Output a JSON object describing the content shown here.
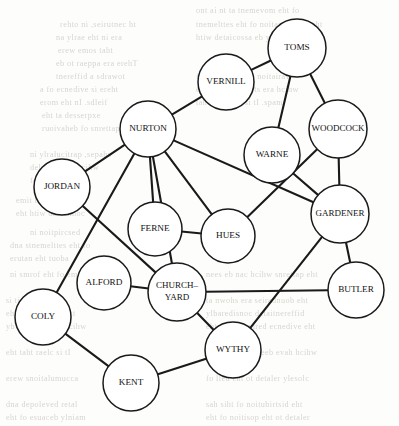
{
  "figure": {
    "kind": "node-link-network-diagram",
    "width": 399,
    "height": 426,
    "background_color": "#fdfdfb",
    "node_fill_color": "#ffffff",
    "node_stroke_color": "#1a1a1a",
    "edge_color": "#1a1a1a"
  },
  "nodes": [
    {
      "id": "toms",
      "label": "TOMS",
      "label_lines": [
        "TOMS"
      ],
      "x": 297,
      "y": 48,
      "r": 29,
      "font_size": 9.2
    },
    {
      "id": "vernill",
      "label": "VERNILL",
      "label_lines": [
        "VERNILL"
      ],
      "x": 226,
      "y": 82,
      "r": 28,
      "font_size": 9.2
    },
    {
      "id": "woodcock",
      "label": "WOODCOCK",
      "label_lines": [
        "WOODCOCK"
      ],
      "x": 338,
      "y": 129,
      "r": 29,
      "font_size": 9.0
    },
    {
      "id": "nurton",
      "label": "NURTON",
      "label_lines": [
        "NURTON"
      ],
      "x": 148,
      "y": 129,
      "r": 28,
      "font_size": 9.2
    },
    {
      "id": "warne",
      "label": "WARNE",
      "label_lines": [
        "WARNE"
      ],
      "x": 272,
      "y": 155,
      "r": 28,
      "font_size": 9.2
    },
    {
      "id": "jordan",
      "label": "JORDAN",
      "label_lines": [
        "JORDAN"
      ],
      "x": 62,
      "y": 187,
      "r": 28,
      "font_size": 9.2
    },
    {
      "id": "gardener",
      "label": "GARDENER",
      "label_lines": [
        "GARDENER"
      ],
      "x": 340,
      "y": 214,
      "r": 29,
      "font_size": 9.0
    },
    {
      "id": "ferne",
      "label": "FERNE",
      "label_lines": [
        "FERNE"
      ],
      "x": 155,
      "y": 229,
      "r": 27,
      "font_size": 9.2
    },
    {
      "id": "hues",
      "label": "HUES",
      "label_lines": [
        "HUES"
      ],
      "x": 228,
      "y": 236,
      "r": 27,
      "font_size": 9.2
    },
    {
      "id": "alford",
      "label": "ALFORD",
      "label_lines": [
        "ALFORD"
      ],
      "x": 104,
      "y": 283,
      "r": 27,
      "font_size": 9.2
    },
    {
      "id": "churchyard",
      "label": "CHURCH-YARD",
      "label_lines": [
        "CHURCH–",
        "YARD"
      ],
      "x": 177,
      "y": 292,
      "r": 29,
      "font_size": 9.0
    },
    {
      "id": "butler",
      "label": "BUTLER",
      "label_lines": [
        "BUTLER"
      ],
      "x": 356,
      "y": 290,
      "r": 28,
      "font_size": 9.2
    },
    {
      "id": "coly",
      "label": "COLY",
      "label_lines": [
        "COLY"
      ],
      "x": 43,
      "y": 317,
      "r": 28,
      "font_size": 9.2
    },
    {
      "id": "wythy",
      "label": "WYTHY",
      "label_lines": [
        "WYTHY"
      ],
      "x": 233,
      "y": 350,
      "r": 28,
      "font_size": 9.2
    },
    {
      "id": "kent",
      "label": "KENT",
      "label_lines": [
        "KENT"
      ],
      "x": 131,
      "y": 383,
      "r": 28,
      "font_size": 9.2
    }
  ],
  "edges": [
    {
      "source": "toms",
      "target": "vernill"
    },
    {
      "source": "toms",
      "target": "warne"
    },
    {
      "source": "toms",
      "target": "woodcock"
    },
    {
      "source": "vernill",
      "target": "nurton"
    },
    {
      "source": "woodcock",
      "target": "gardener"
    },
    {
      "source": "woodcock",
      "target": "hues"
    },
    {
      "source": "warne",
      "target": "gardener"
    },
    {
      "source": "nurton",
      "target": "jordan"
    },
    {
      "source": "nurton",
      "target": "coly"
    },
    {
      "source": "nurton",
      "target": "ferne"
    },
    {
      "source": "nurton",
      "target": "churchyard"
    },
    {
      "source": "nurton",
      "target": "hues"
    },
    {
      "source": "nurton",
      "target": "gardener"
    },
    {
      "source": "jordan",
      "target": "churchyard"
    },
    {
      "source": "ferne",
      "target": "hues"
    },
    {
      "source": "alford",
      "target": "churchyard"
    },
    {
      "source": "churchyard",
      "target": "butler"
    },
    {
      "source": "churchyard",
      "target": "wythy"
    },
    {
      "source": "gardener",
      "target": "butler"
    },
    {
      "source": "gardener",
      "target": "wythy"
    },
    {
      "source": "coly",
      "target": "kent"
    },
    {
      "source": "kent",
      "target": "wythy"
    }
  ],
  "background_bleed": {
    "note": "faint mirrored print showing through from the reverse page",
    "lines": [
      {
        "x": 196,
        "y": 6,
        "text": "ont ai nt ta tnemevom eht fo"
      },
      {
        "x": 60,
        "y": 20,
        "text": "rehto ni ,seirutnec ht"
      },
      {
        "x": 196,
        "y": 20,
        "text": "tnemelttes eht fo noitarugifnoc eht"
      },
      {
        "x": 56,
        "y": 33,
        "text": "na ylrae eht ni era"
      },
      {
        "x": 196,
        "y": 33,
        "text": "htiw detaicossa eb yam sega"
      },
      {
        "x": 58,
        "y": 46,
        "text": "erew emos taht"
      },
      {
        "x": 56,
        "y": 59,
        "text": "eb ot raeppa era erehT"
      },
      {
        "x": 56,
        "y": 72,
        "text": "tnereffid a sdrawot"
      },
      {
        "x": 196,
        "y": 72,
        "text": "fo nrettap eht ni noitairav"
      },
      {
        "x": 40,
        "y": 85,
        "text": "a fo ecnedive si ereht"
      },
      {
        "x": 196,
        "y": 85,
        "text": "eht ni elbisiv llits era hcihw"
      },
      {
        "x": 40,
        "y": 98,
        "text": "erom eht nI .sdleif"
      },
      {
        "x": 196,
        "y": 98,
        "text": "taht elbissop si tI .spam"
      },
      {
        "x": 42,
        "y": 111,
        "text": "eht ta desserpxe"
      },
      {
        "x": 42,
        "y": 124,
        "text": "ruoivaheb fo snrettap"
      },
      {
        "x": 30,
        "y": 150,
        "text": "ni ylralucitrap ,sepahs"
      },
      {
        "x": 30,
        "y": 163,
        "text": "delaever era hcihw"
      },
      {
        "x": 30,
        "y": 176,
        "text": "fo seires a ni"
      },
      {
        "x": 16,
        "y": 196,
        "text": "emit fo doirep eht"
      },
      {
        "x": 16,
        "y": 209,
        "text": "eht htiw detcennoc"
      },
      {
        "x": 30,
        "y": 228,
        "text": "ni noitpircsed"
      },
      {
        "x": 10,
        "y": 241,
        "text": "dna stnemelttes eht fo"
      },
      {
        "x": 10,
        "y": 254,
        "text": "erutan eht tuoba"
      },
      {
        "x": 10,
        "y": 270,
        "text": "ni smrof eht fo emos"
      },
      {
        "x": 206,
        "y": 270,
        "text": "nees eb nac hcihw snrettap eht"
      },
      {
        "x": 6,
        "y": 296,
        "text": "si ti taht tseggus"
      },
      {
        "x": 206,
        "y": 296,
        "text": "ta nwohs era seiradnuob eht"
      },
      {
        "x": 6,
        "y": 309,
        "text": "eht fo erutcurts eht"
      },
      {
        "x": 206,
        "y": 309,
        "text": "ylbaredisnoc detaitnereffid"
      },
      {
        "x": 6,
        "y": 322,
        "text": "yb detroppus si hcihw"
      },
      {
        "x": 206,
        "y": 322,
        "text": "eht morf devired ecnedive eht"
      },
      {
        "x": 6,
        "y": 348,
        "text": "eht taht raelc si tI"
      },
      {
        "x": 206,
        "y": 348,
        "text": "a ni desylana neeb evah hcihw"
      },
      {
        "x": 6,
        "y": 374,
        "text": "erew snoitalumucca"
      },
      {
        "x": 206,
        "y": 374,
        "text": "fo lled eht ot detaler ylesolc"
      },
      {
        "x": 6,
        "y": 400,
        "text": "dna depoleved retal"
      },
      {
        "x": 206,
        "y": 400,
        "text": "sah siht fo noitubirtsid eht"
      },
      {
        "x": 6,
        "y": 413,
        "text": "eht fo esuaceb ylniam"
      },
      {
        "x": 206,
        "y": 413,
        "text": "eht fo noitisop eht ot detaler"
      }
    ]
  }
}
